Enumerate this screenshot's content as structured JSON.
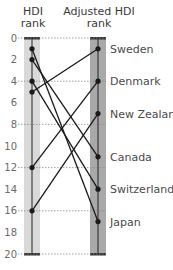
{
  "chart_data": {
    "type": "slope",
    "title": "",
    "left_axis_label": "HDI rank",
    "right_axis_label": "Adjusted HDI rank",
    "left_label_lines": [
      "HDI",
      "rank"
    ],
    "right_label_lines": [
      "Adjusted HDI",
      "rank"
    ],
    "y_ticks": [
      0,
      2,
      4,
      6,
      8,
      10,
      12,
      14,
      16,
      18,
      20
    ],
    "dotted_gridlines": [
      0,
      4,
      8,
      12,
      16,
      20
    ],
    "ylim": [
      0,
      20
    ],
    "y_inverted": true,
    "series": [
      {
        "name": "Sweden",
        "hdi_rank": 5,
        "adjusted_hdi_rank": 1
      },
      {
        "name": "Denmark",
        "hdi_rank": 12,
        "adjusted_hdi_rank": 4
      },
      {
        "name": "New Zealand",
        "hdi_rank": 16,
        "adjusted_hdi_rank": 7
      },
      {
        "name": "Canada",
        "hdi_rank": 2,
        "adjusted_hdi_rank": 11
      },
      {
        "name": "Switzerland",
        "hdi_rank": 4,
        "adjusted_hdi_rank": 14
      },
      {
        "name": "Japan",
        "hdi_rank": 1,
        "adjusted_hdi_rank": 17
      }
    ],
    "colors": {
      "left_band": "#d9d9d9",
      "right_band": "#a9a9a9",
      "line": "#1a1a1a",
      "grid": "#8a8a8a"
    }
  }
}
